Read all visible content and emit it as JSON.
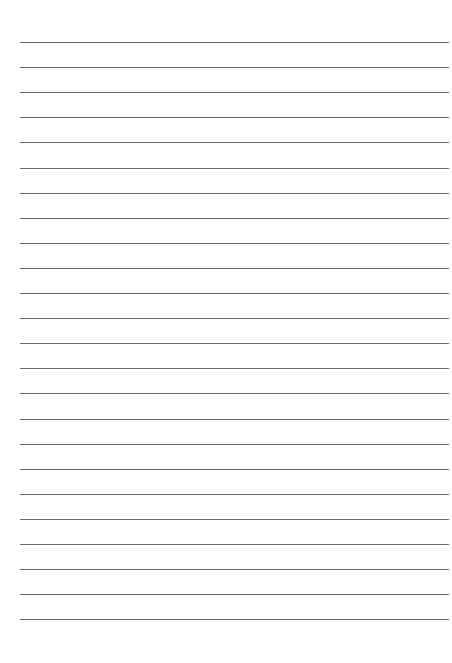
{
  "document": {
    "type": "lined-paper",
    "background_color": "#ffffff",
    "line_color": "#6a6a6a",
    "line_count": 24,
    "first_line_y": 42,
    "line_spacing": 25.1,
    "line_left": 20,
    "line_right": 449,
    "text": []
  }
}
